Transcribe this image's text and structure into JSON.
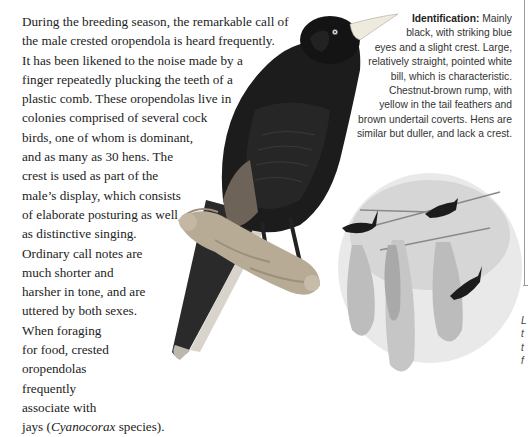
{
  "main_text": {
    "lines": [
      "During the breeding season, the remarkable call of",
      "the male crested oropendola is heard frequently.",
      "It has been likened to the noise made by a",
      "finger repeatedly plucking the teeth of a",
      "plastic comb. These oropendolas live in",
      "colonies comprised of several cock",
      "birds, one of whom is dominant,",
      "and as many as 30 hens. The",
      "crest is used as part of the",
      "male’s display, which consists",
      "of elaborate posturing as well",
      "as distinctive singing.",
      "Ordinary call notes are",
      "much shorter and",
      "harsher in tone, and are",
      "uttered by both sexes.",
      "When foraging",
      "for food, crested",
      "oropendolas",
      "frequently",
      "associate with"
    ],
    "last_line": {
      "before": "jays (",
      "italic": "Cyanocorax",
      "after": " species)."
    }
  },
  "identification": {
    "label": "Identification:",
    "first_line_rest": " Mainly",
    "lines": [
      "black, with striking blue",
      "eyes and a slight crest. Large,",
      "relatively straight, pointed white",
      "bill, which is characteristic.",
      "Chestnut-brown rump, with",
      "yellow in the tail feathers and",
      "brown undertail coverts. Hens are",
      "similar but duller, and lack a crest."
    ]
  },
  "caption_fragment": [
    "L",
    "t",
    "t",
    "f"
  ],
  "illustrations": {
    "main": "crested-oropendola-perched",
    "inset": "oropendola-colony-hanging-nests"
  },
  "colors": {
    "text": "#222222",
    "bird_black": "#1a1a1a",
    "bill": "#f2efe2",
    "eye": "#cfe0ee",
    "rump": "#7a6a5a",
    "moss": "#b8ab96",
    "frame": "#9a9a9a"
  }
}
